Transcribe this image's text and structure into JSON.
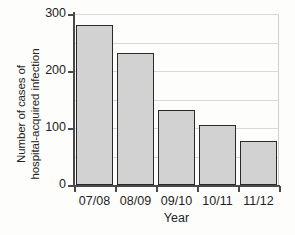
{
  "chart_data": {
    "type": "bar",
    "title": "",
    "xlabel": "Year",
    "ylabel": "Number of cases of hospital-acquired infection",
    "ylabel_lines": [
      "Number of cases of",
      "hospital-acquired infection"
    ],
    "categories": [
      "07/08",
      "08/09",
      "09/10",
      "10/11",
      "11/12"
    ],
    "values": [
      281,
      232,
      132,
      106,
      78
    ],
    "ylim": [
      0,
      300
    ],
    "xlim_note": "categorical",
    "y_ticks": [
      0,
      100,
      200,
      300
    ],
    "y_tick_labels": [
      "0",
      "100",
      "200",
      "300"
    ],
    "gridlines": [
      50,
      100,
      150,
      200,
      250,
      300
    ],
    "grid": true,
    "legend": null,
    "legend_position": "none",
    "series": [
      {
        "name": "Hospital-acquired infection cases",
        "values": [
          281,
          232,
          132,
          106,
          78
        ]
      }
    ],
    "bar_fill_color": "#d2d2d2",
    "bar_border_color": "#2a2a2a",
    "axis_color": "#4a4a4a",
    "grid_color": "#d8d8d8"
  },
  "figure": {
    "x_axis_title": "Year"
  }
}
